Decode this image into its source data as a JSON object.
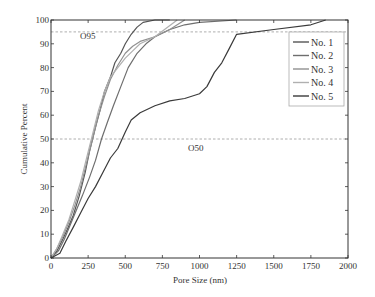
{
  "chart_data": {
    "type": "line",
    "title": "",
    "xlabel": "Pore Size (nm)",
    "ylabel": "Cumulative Percent",
    "xlim": [
      0,
      2000
    ],
    "ylim": [
      0,
      100
    ],
    "xticks": [
      0,
      250,
      500,
      750,
      1000,
      1250,
      1500,
      1750,
      2000
    ],
    "yticks": [
      0,
      10,
      20,
      30,
      40,
      50,
      60,
      70,
      80,
      90,
      100
    ],
    "grid": false,
    "legend_position": "upper right",
    "reference_lines": [
      {
        "label": "O95",
        "y": 95,
        "style": "dashed"
      },
      {
        "label": "O50",
        "y": 50,
        "style": "dashed"
      }
    ],
    "series": [
      {
        "name": "No. 1",
        "color": "#555555",
        "x": [
          0,
          40,
          80,
          110,
          150,
          190,
          230,
          260,
          300,
          330,
          360,
          400,
          430,
          470,
          500,
          540,
          580,
          620,
          700,
          800
        ],
        "y": [
          0,
          3,
          8,
          12,
          18,
          26,
          36,
          45,
          55,
          62,
          70,
          76,
          82,
          86,
          90,
          94,
          97,
          99,
          100,
          100
        ]
      },
      {
        "name": "No. 2",
        "color": "#6e6e6e",
        "x": [
          0,
          50,
          90,
          130,
          170,
          210,
          260,
          300,
          340,
          380,
          420,
          470,
          520,
          580,
          640,
          700,
          800,
          900,
          1000,
          1250
        ],
        "y": [
          0,
          3,
          8,
          14,
          20,
          26,
          34,
          41,
          50,
          57,
          64,
          72,
          80,
          86,
          90,
          93,
          96,
          98,
          99,
          100
        ]
      },
      {
        "name": "No. 3",
        "color": "#909090",
        "x": [
          0,
          40,
          80,
          120,
          160,
          200,
          240,
          280,
          320,
          360,
          400,
          450,
          500,
          550,
          600,
          700,
          800,
          900
        ],
        "y": [
          0,
          4,
          9,
          15,
          22,
          30,
          40,
          50,
          60,
          68,
          75,
          81,
          86,
          89,
          91,
          93,
          96,
          100
        ]
      },
      {
        "name": "No. 4",
        "color": "#b0b0b0",
        "x": [
          0,
          40,
          80,
          120,
          160,
          200,
          240,
          280,
          320,
          360,
          400,
          450,
          500,
          550,
          600,
          700,
          850
        ],
        "y": [
          0,
          4,
          10,
          16,
          24,
          32,
          42,
          52,
          62,
          70,
          76,
          80,
          84,
          87,
          90,
          93,
          100
        ]
      },
      {
        "name": "No. 5",
        "color": "#3a3a3a",
        "x": [
          0,
          60,
          100,
          150,
          200,
          250,
          300,
          350,
          400,
          450,
          500,
          540,
          600,
          700,
          800,
          900,
          1000,
          1050,
          1100,
          1150,
          1200,
          1250,
          1500,
          1750,
          1850
        ],
        "y": [
          0,
          2,
          7,
          13,
          19,
          25,
          30,
          36,
          42,
          46,
          53,
          58,
          61,
          64,
          66,
          67,
          69,
          72,
          78,
          82,
          88,
          94,
          96,
          98,
          100
        ]
      }
    ]
  },
  "legend": {
    "items": [
      {
        "label": "No. 1"
      },
      {
        "label": "No. 2"
      },
      {
        "label": "No. 3"
      },
      {
        "label": "No. 4"
      },
      {
        "label": "No. 5"
      }
    ]
  },
  "annotations": {
    "o95": "O95",
    "o50": "O50"
  },
  "axes": {
    "xlabel": "Pore Size (nm)",
    "ylabel": "Cumulative Percent"
  }
}
